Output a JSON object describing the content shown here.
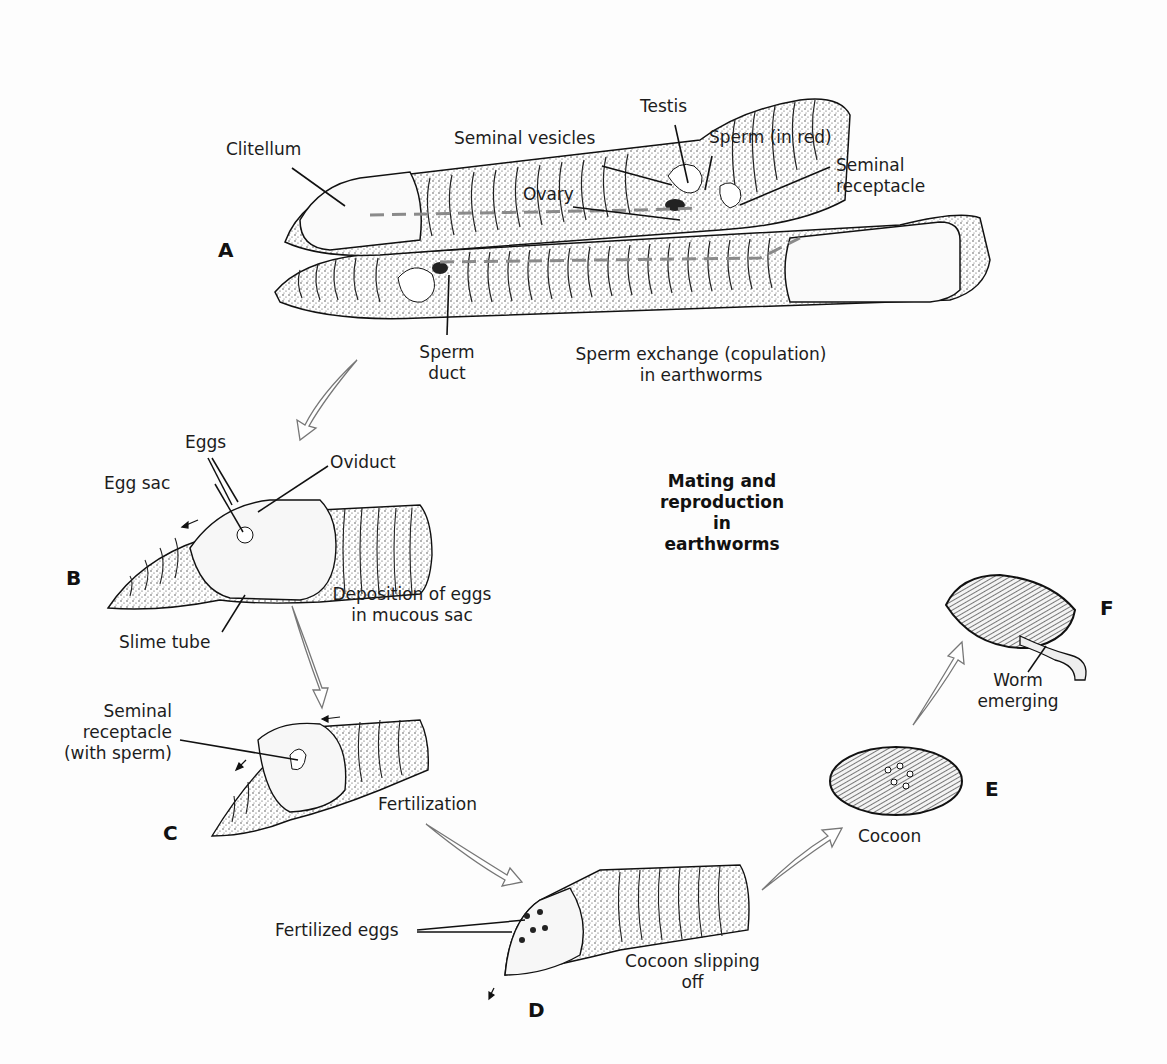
{
  "title": [
    "Mating and",
    "reproduction",
    "in",
    "earthworms"
  ],
  "panels": {
    "A": {
      "letter": "A",
      "caption": [
        "Sperm exchange (copulation)",
        "in earthworms"
      ],
      "labels": {
        "clitellum": "Clitellum",
        "seminal_vesicles": "Seminal vesicles",
        "testis": "Testis",
        "sperm": "Sperm (in red)",
        "ovary": "Ovary",
        "seminal_receptacle": [
          "Seminal",
          "receptacle"
        ],
        "sperm_duct": [
          "Sperm",
          "duct"
        ]
      }
    },
    "B": {
      "letter": "B",
      "caption": [
        "Deposition of eggs",
        "in mucous sac"
      ],
      "labels": {
        "eggs": "Eggs",
        "egg_sac": "Egg sac",
        "oviduct": "Oviduct",
        "slime_tube": "Slime tube"
      }
    },
    "C": {
      "letter": "C",
      "caption": "Fertilization",
      "labels": {
        "seminal_receptacle": [
          "Seminal",
          "receptacle",
          "(with sperm)"
        ]
      }
    },
    "D": {
      "letter": "D",
      "caption": [
        "Cocoon slipping",
        "off"
      ],
      "labels": {
        "fertilized_eggs": "Fertilized eggs"
      }
    },
    "E": {
      "letter": "E",
      "caption": "Cocoon"
    },
    "F": {
      "letter": "F",
      "caption": [
        "Worm",
        "emerging"
      ]
    }
  },
  "colors": {
    "ink": "#1a1a1a",
    "sperm": "#8a8a8a",
    "background": "#fdfdfd"
  }
}
